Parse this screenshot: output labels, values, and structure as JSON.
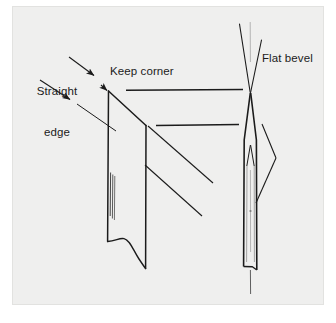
{
  "figure": {
    "type": "technical-line-diagram",
    "panel": {
      "background_color": "#efefee",
      "border_color": "#e2e2e0",
      "page_background": "#ffffff"
    },
    "ink_color": "#1b1b1b",
    "labels": [
      {
        "id": "straight-edge",
        "text_line_1": "Straight",
        "text_line_2": "edge",
        "full_text": "Straight edge"
      },
      {
        "id": "keep-corner",
        "full_text": "Keep corner"
      },
      {
        "id": "flat-bevel",
        "full_text": "Flat bevel"
      }
    ],
    "shapes": {
      "left_blade": {
        "name": "chisel-blade-face-parallelogram",
        "description": "Parallelogram blade face with vertical side edges, slanted top edge and wavy bottom edge, with fine hatch lines inside"
      },
      "right_blade": {
        "name": "chisel-blade-edge-on",
        "description": "Edge-on narrow blade with converging V at top indicating flat bevel and inner chevron detail"
      }
    },
    "leader_lines": {
      "straight_edge_arrows": 2,
      "keep_corner_arrows": 1,
      "horizontal_leaders": 2,
      "diagonal_leaders": 2,
      "flat_bevel_leader": 1
    }
  }
}
